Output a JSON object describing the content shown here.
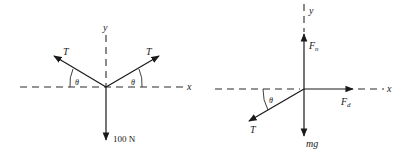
{
  "figure": {
    "left_diagram": {
      "axes": {
        "x_label": "x",
        "y_label": "y"
      },
      "vectors": [
        {
          "name": "tension-left",
          "label": "T",
          "angle_label": "θ"
        },
        {
          "name": "tension-right",
          "label": "T",
          "angle_label": "θ"
        },
        {
          "name": "weight",
          "label": "100 N"
        }
      ]
    },
    "right_diagram": {
      "axes": {
        "x_label": "x",
        "y_label": "y"
      },
      "vectors": [
        {
          "name": "normal-force",
          "label": "F",
          "subscript": "n"
        },
        {
          "name": "drag-force",
          "label": "F",
          "subscript": "d"
        },
        {
          "name": "tension",
          "label": "T",
          "angle_label": "θ"
        },
        {
          "name": "weight",
          "label": "mg"
        }
      ]
    },
    "colors": {
      "line": "#1a1a1a",
      "background": "#ffffff"
    }
  }
}
